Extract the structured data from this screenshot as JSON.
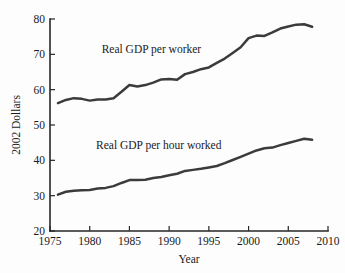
{
  "chart_data": {
    "type": "line",
    "title": "",
    "xlabel": "Year",
    "ylabel": "2002 Dollars",
    "xlim": [
      1975,
      2010
    ],
    "ylim": [
      20,
      80
    ],
    "xticks": [
      1975,
      1980,
      1985,
      1990,
      1995,
      2000,
      2005,
      2010
    ],
    "yticks": [
      20,
      30,
      40,
      50,
      60,
      70,
      80
    ],
    "grid": false,
    "legend_position": "inline-annotation",
    "line_color": "#3b3b3b",
    "axis_color": "#262626",
    "background_color": "#fdfdfd",
    "x": [
      1976,
      1977,
      1978,
      1979,
      1980,
      1981,
      1982,
      1983,
      1984,
      1985,
      1986,
      1987,
      1988,
      1989,
      1990,
      1991,
      1992,
      1993,
      1994,
      1995,
      1996,
      1997,
      1998,
      1999,
      2000,
      2001,
      2002,
      2003,
      2004,
      2005,
      2006,
      2007,
      2008
    ],
    "series": [
      {
        "name": "Real GDP per worker",
        "annotation": "Real GDP per worker",
        "values": [
          56.2,
          57.1,
          57.6,
          57.4,
          56.9,
          57.2,
          57.2,
          57.6,
          59.4,
          61.3,
          60.9,
          61.3,
          62.0,
          62.9,
          63.0,
          62.8,
          64.4,
          65.0,
          65.8,
          66.3,
          67.6,
          68.8,
          70.4,
          72.0,
          74.6,
          75.3,
          75.2,
          76.2,
          77.3,
          77.9,
          78.4,
          78.5,
          77.8
        ]
      },
      {
        "name": "Real GDP per hour worked",
        "annotation": "Real GDP per hour worked",
        "values": [
          30.3,
          31.1,
          31.4,
          31.5,
          31.6,
          32.0,
          32.2,
          32.7,
          33.6,
          34.4,
          34.4,
          34.5,
          35.0,
          35.3,
          35.8,
          36.2,
          37.0,
          37.3,
          37.6,
          38.0,
          38.4,
          39.2,
          40.1,
          41.0,
          41.9,
          42.8,
          43.4,
          43.6,
          44.3,
          44.9,
          45.5,
          46.1,
          45.8
        ]
      }
    ],
    "annotations": [
      {
        "text": "Real GDP per worker",
        "x": 1981.5,
        "y": 70.5
      },
      {
        "text": "Real GDP per hour worked",
        "x": 1980.8,
        "y": 43.2
      }
    ]
  }
}
